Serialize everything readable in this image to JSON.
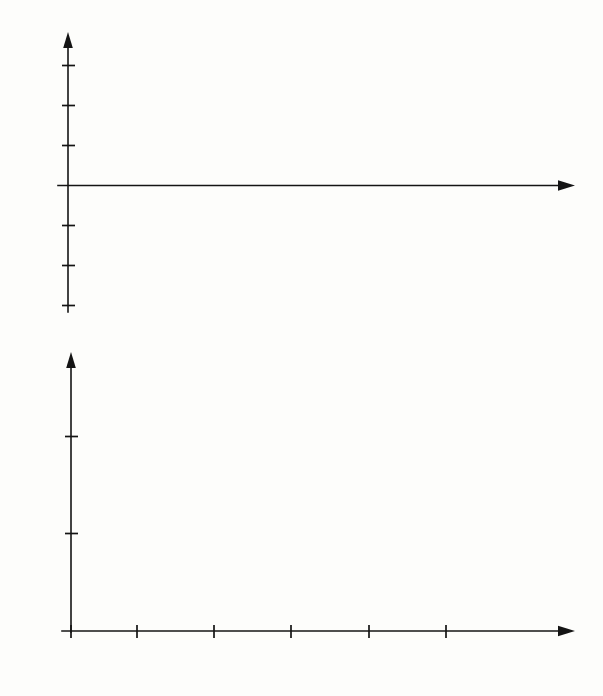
{
  "figure": {
    "background_color": "#fdfdfb",
    "line_color": "#0d0d0d",
    "panels": [
      "top-control-signal",
      "bottom-system-response"
    ]
  },
  "top_panel": {
    "y_axis_label": "u",
    "x_axis_label": "t",
    "y_ticks": [
      "3",
      "2",
      "1",
      "-1",
      "-2",
      "-3"
    ],
    "x_ticks": [
      "1",
      "2",
      "3",
      "4",
      "5"
    ]
  },
  "bottom_panel": {
    "y_axis_label": "y",
    "x_axis_label": "",
    "y_ticks": [
      "1",
      "0.5",
      "0"
    ],
    "x_ticks": [
      "0",
      "1",
      "2",
      "3",
      "4",
      "5"
    ]
  },
  "chart_data": [
    {
      "type": "line",
      "id": "control-signal",
      "title": "",
      "xlabel": "t",
      "ylabel": "u",
      "xlim": [
        0,
        6.6
      ],
      "ylim": [
        -3.6,
        3.4
      ],
      "grid": false,
      "legend": "none",
      "style": "staircase",
      "xticks": [
        1,
        2,
        3,
        4,
        5
      ],
      "xticklabels": [
        "1",
        "2",
        "3",
        "4",
        "5"
      ],
      "yticks": [
        3,
        2,
        1,
        -1,
        -2,
        -3
      ],
      "yticklabels": [
        "3",
        "2",
        "1",
        "-1",
        "-2",
        "-3"
      ],
      "step_intervals": [
        {
          "from": 0,
          "to": 1,
          "value": 2.7
        },
        {
          "from": 1,
          "to": 2,
          "value": -3.0
        },
        {
          "from": 2,
          "to": 3,
          "value": 2.05
        },
        {
          "from": 3,
          "to": 4,
          "value": -1.65
        },
        {
          "from": 4,
          "to": 5,
          "value": 1.0
        },
        {
          "from": 5,
          "to": 6.05,
          "value": -1.0
        }
      ],
      "x": [
        0,
        1,
        1,
        2,
        2,
        3,
        3,
        4,
        4,
        5,
        5,
        6.05
      ],
      "values": [
        2.7,
        2.7,
        -3.0,
        -3.0,
        2.05,
        2.05,
        -1.65,
        -1.65,
        1.0,
        1.0,
        -1.0,
        -1.0
      ]
    },
    {
      "type": "line",
      "id": "system-response",
      "title": "",
      "xlabel": "",
      "ylabel": "y",
      "xlim": [
        0,
        6.6
      ],
      "ylim": [
        0,
        1.55
      ],
      "grid": false,
      "legend": "none",
      "style": "smooth",
      "xticks": [
        0,
        1,
        2,
        3,
        4,
        5
      ],
      "xticklabels": [
        "0",
        "1",
        "2",
        "3",
        "4",
        "5"
      ],
      "yticks": [
        0,
        0.5,
        1
      ],
      "yticklabels": [
        "0",
        "0.5",
        "1"
      ],
      "x": [
        0.0,
        0.1,
        0.2,
        0.3,
        0.4,
        0.5,
        0.6,
        0.7,
        0.8,
        0.9,
        1.0,
        1.1,
        1.2,
        1.3,
        1.4,
        1.5,
        1.6,
        1.7,
        1.8,
        1.9,
        2.0,
        2.1,
        2.2,
        2.3,
        2.4,
        2.5,
        2.6,
        2.7,
        2.8,
        2.9,
        3.0,
        3.1,
        3.2,
        3.3,
        3.4,
        3.5,
        3.6,
        3.7,
        3.8,
        3.9,
        4.0,
        4.1,
        4.2,
        4.3,
        4.4,
        4.5,
        4.6,
        4.7,
        4.8,
        4.9,
        5.0
      ],
      "values": [
        0.0,
        0.015,
        0.055,
        0.115,
        0.2,
        0.31,
        0.45,
        0.6,
        0.75,
        0.88,
        0.99,
        1.11,
        1.22,
        1.31,
        1.36,
        1.38,
        1.36,
        1.31,
        1.23,
        1.12,
        0.995,
        0.93,
        0.865,
        0.81,
        0.775,
        0.76,
        0.775,
        0.81,
        0.865,
        0.93,
        0.985,
        1.055,
        1.115,
        1.16,
        1.185,
        1.19,
        1.18,
        1.155,
        1.115,
        1.055,
        0.99,
        0.945,
        0.905,
        0.878,
        0.865,
        0.862,
        0.872,
        0.893,
        0.92,
        0.948,
        0.97
      ],
      "markers": {
        "symbol": "star",
        "x": [
          1,
          2,
          3,
          4,
          5
        ],
        "y": [
          0.99,
          0.995,
          0.985,
          0.99,
          0.97
        ]
      },
      "origin_marker": {
        "symbol": "star",
        "x": 0,
        "y": 0
      }
    }
  ]
}
